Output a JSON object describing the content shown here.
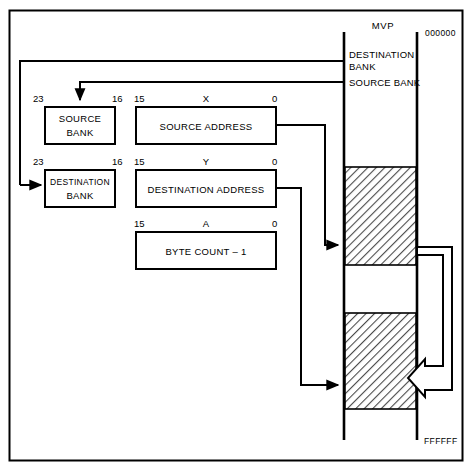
{
  "figure": {
    "frame": {
      "name": "outer-border"
    },
    "memory_column": {
      "top_label": "MVP",
      "start_address": "000000",
      "end_address": "FFFFFF",
      "bank_labels": [
        "DESTINATION",
        "BANK",
        "SOURCE BANK"
      ],
      "blocks": [
        {
          "name": "source-block",
          "fill": "hatched"
        },
        {
          "name": "gap-block",
          "fill": "empty"
        },
        {
          "name": "destination-block",
          "fill": "hatched"
        }
      ]
    },
    "registers": [
      {
        "id": "source-bank",
        "label_line1": "SOURCE",
        "label_line2": "BANK",
        "bit_high": "23",
        "bit_low": "16",
        "register_name": ""
      },
      {
        "id": "source-address",
        "label_line1": "SOURCE ADDRESS",
        "label_line2": "",
        "bit_high": "15",
        "bit_low": "0",
        "register_name": "X"
      },
      {
        "id": "destination-bank",
        "label_line1": "DESTINATION",
        "label_line2": "BANK",
        "bit_high": "23",
        "bit_low": "16",
        "register_name": ""
      },
      {
        "id": "destination-address",
        "label_line1": "DESTINATION ADDRESS",
        "label_line2": "",
        "bit_high": "15",
        "bit_low": "0",
        "register_name": "Y"
      },
      {
        "id": "byte-count",
        "label_line1": "BYTE COUNT  –  1",
        "label_line2": "",
        "bit_high": "15",
        "bit_low": "0",
        "register_name": "A"
      }
    ],
    "colors": {
      "line": "#000000",
      "background": "#ffffff",
      "hatch": "#555555"
    }
  }
}
